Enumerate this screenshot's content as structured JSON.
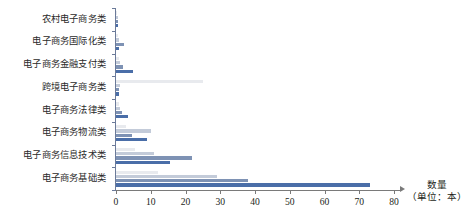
{
  "chart_data": {
    "type": "bar",
    "orientation": "horizontal",
    "title": "",
    "xlabel": "数量",
    "xlabel_unit": "（单位：本）",
    "ylabel": "",
    "xlim": [
      0,
      80
    ],
    "xticks": [
      0,
      10,
      20,
      30,
      40,
      50,
      60,
      70,
      80
    ],
    "xtick_labels": [
      "0",
      "10",
      "20",
      "30",
      "40",
      "50",
      "60",
      "70",
      "80"
    ],
    "grid": false,
    "legend": "none",
    "categories": [
      "农村电子商务类",
      "电子商务国际化类",
      "电子商务金融支付类",
      "跨境电子商务类",
      "电子商务法律类",
      "电子商务物流类",
      "电子商务信息技术类",
      "电子商务基础类"
    ],
    "series": [
      {
        "name": "series-1",
        "color": "#e8eaee",
        "values": [
          0.4,
          0.6,
          0.8,
          25.0,
          1.0,
          3.0,
          5.5,
          12.0
        ]
      },
      {
        "name": "series-2",
        "color": "#c3cbd9",
        "values": [
          0.5,
          0.8,
          1.2,
          1.2,
          1.2,
          10.0,
          11.0,
          29.0
        ]
      },
      {
        "name": "series-3",
        "color": "#7e92b4",
        "values": [
          0.6,
          2.2,
          2.0,
          0.9,
          1.6,
          4.5,
          22.0,
          38.0
        ]
      },
      {
        "name": "series-4",
        "color": "#4a6ea8",
        "values": [
          0.5,
          0.9,
          4.8,
          0.8,
          3.5,
          9.0,
          15.5,
          73.0
        ]
      }
    ]
  },
  "axis": {
    "color_axis_y": "#6b7a99",
    "color_axis_x": "#7a7a7a"
  }
}
